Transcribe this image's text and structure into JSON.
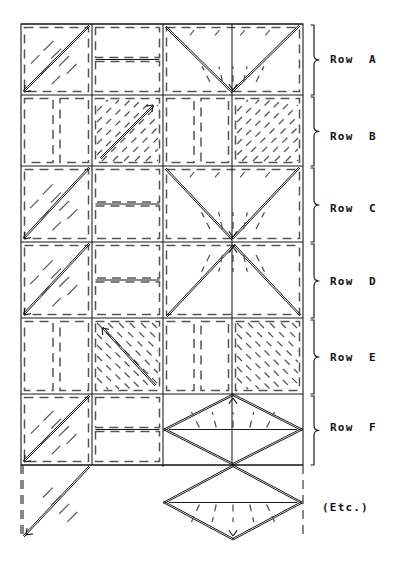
{
  "figure": {
    "kind": "quilt-block-layout-diagram",
    "background_color": "#ffffff",
    "ink_color": "#1a1a1a",
    "dash_color": "#555555",
    "canvas": {
      "width": 402,
      "height": 571
    }
  },
  "grid": {
    "left": 21,
    "right": 303,
    "top": 24,
    "bottom": 465,
    "columns": [
      21,
      92,
      163,
      232,
      303
    ],
    "rows": [
      {
        "id": "A",
        "top": 24,
        "bottom": 95
      },
      {
        "id": "B",
        "top": 95,
        "bottom": 166
      },
      {
        "id": "C",
        "top": 166,
        "bottom": 242
      },
      {
        "id": "D",
        "top": 242,
        "bottom": 318
      },
      {
        "id": "E",
        "top": 318,
        "bottom": 394
      },
      {
        "id": "F",
        "top": 394,
        "bottom": 465
      }
    ],
    "etc_band": {
      "top": 465,
      "bottom": 540
    }
  },
  "labels": {
    "rows": [
      {
        "id": "A",
        "text": "Row  A",
        "x": 330,
        "y": 60,
        "bracket_top": 25,
        "bracket_bottom": 95
      },
      {
        "id": "B",
        "text": "Row  B",
        "x": 330,
        "y": 137,
        "bracket_top": 97,
        "bracket_bottom": 166
      },
      {
        "id": "C",
        "text": "Row  C",
        "x": 330,
        "y": 209,
        "bracket_top": 168,
        "bracket_bottom": 242
      },
      {
        "id": "D",
        "text": "Row  D",
        "x": 330,
        "y": 282,
        "bracket_top": 244,
        "bracket_bottom": 318
      },
      {
        "id": "E",
        "text": "Row  E",
        "x": 330,
        "y": 358,
        "bracket_top": 320,
        "bracket_bottom": 394
      },
      {
        "id": "F",
        "text": "Row  F",
        "x": 330,
        "y": 428,
        "bracket_top": 396,
        "bracket_bottom": 465
      }
    ],
    "etc": {
      "text": "(Etc.)",
      "x": 322,
      "y": 508
    }
  },
  "chart_data": {
    "type": "diagram",
    "title": "",
    "legend": [],
    "rows": [
      {
        "id": "A",
        "units": [
          {
            "col": 0,
            "span": 1,
            "type": "half-square-triangle",
            "arrow": "down-left",
            "hatch": "diag-up"
          },
          {
            "col": 1,
            "span": 1,
            "type": "split-rectangles",
            "arrow": "none",
            "hatch": "none"
          },
          {
            "col": 2,
            "span": 2,
            "type": "flying-geese-v",
            "arrow": "down",
            "hatch": "fan-down"
          }
        ]
      },
      {
        "id": "B",
        "units": [
          {
            "col": 0,
            "span": 1,
            "type": "plain-pair",
            "arrow": "none",
            "hatch": "none"
          },
          {
            "col": 1,
            "span": 1,
            "type": "hatched-square",
            "arrow": "up-right",
            "hatch": "diag-up"
          },
          {
            "col": 2,
            "span": 1,
            "type": "plain-pair",
            "arrow": "none",
            "hatch": "none"
          },
          {
            "col": 3,
            "span": 1,
            "type": "hatched-square",
            "arrow": "none",
            "hatch": "diag-up"
          }
        ]
      },
      {
        "id": "C",
        "units": [
          {
            "col": 0,
            "span": 1,
            "type": "half-square-triangle",
            "arrow": "down-left",
            "hatch": "diag-up"
          },
          {
            "col": 1,
            "span": 1,
            "type": "split-rectangles",
            "arrow": "none",
            "hatch": "none"
          },
          {
            "col": 2,
            "span": 2,
            "type": "flying-geese-v",
            "arrow": "down",
            "hatch": "fan-down"
          }
        ]
      },
      {
        "id": "D",
        "units": [
          {
            "col": 0,
            "span": 1,
            "type": "half-square-triangle",
            "arrow": "down-left-mirror",
            "hatch": "diag-down"
          },
          {
            "col": 1,
            "span": 1,
            "type": "split-rectangles",
            "arrow": "none",
            "hatch": "none"
          },
          {
            "col": 2,
            "span": 2,
            "type": "flying-geese-caret",
            "arrow": "up",
            "hatch": "fan-up"
          }
        ]
      },
      {
        "id": "E",
        "units": [
          {
            "col": 0,
            "span": 1,
            "type": "plain-pair",
            "arrow": "none",
            "hatch": "none"
          },
          {
            "col": 1,
            "span": 1,
            "type": "hatched-square",
            "arrow": "up-left",
            "hatch": "diag-down"
          },
          {
            "col": 2,
            "span": 1,
            "type": "plain-pair",
            "arrow": "none",
            "hatch": "none"
          },
          {
            "col": 3,
            "span": 1,
            "type": "hatched-square",
            "arrow": "none",
            "hatch": "diag-down"
          }
        ]
      },
      {
        "id": "F",
        "units": [
          {
            "col": 0,
            "span": 1,
            "type": "half-square-triangle",
            "arrow": "down-left-mirror",
            "hatch": "diag-down"
          },
          {
            "col": 1,
            "span": 1,
            "type": "split-rectangles",
            "arrow": "none",
            "hatch": "none"
          },
          {
            "col": 2,
            "span": 2,
            "type": "diamond-up",
            "arrow": "up",
            "hatch": "fan-up"
          }
        ]
      },
      {
        "id": "Etc",
        "units": [
          {
            "col": 0,
            "span": 1,
            "type": "triangle-down-left",
            "arrow": "down-left",
            "hatch": "diag-down"
          },
          {
            "col": 2,
            "span": 2,
            "type": "diamond-down",
            "arrow": "down",
            "hatch": "fan-down"
          }
        ]
      }
    ]
  }
}
